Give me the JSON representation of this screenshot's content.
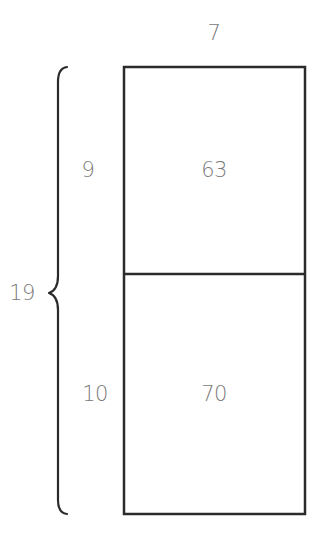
{
  "diagram": {
    "type": "area-model",
    "width_label": "7",
    "total_height_label": "19",
    "parts": [
      {
        "height_label": "9",
        "area_label": "63"
      },
      {
        "height_label": "10",
        "area_label": "70"
      }
    ],
    "colors": {
      "stroke": "#2b2b2b",
      "text": "#7a7a7a",
      "background": "#ffffff"
    }
  }
}
